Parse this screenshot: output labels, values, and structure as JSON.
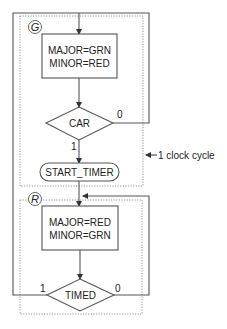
{
  "states": [
    {
      "id": "G",
      "label": "G",
      "output_line1": "MAJOR=GRN",
      "output_line2": "MINOR=RED",
      "decision": "CAR",
      "branch_true": "1",
      "branch_false": "0",
      "conditional_output": "START_TIMER"
    },
    {
      "id": "R",
      "label": "R",
      "output_line1": "MAJOR=RED",
      "output_line2": "MINOR=GRN",
      "decision": "TIMED",
      "branch_true": "1",
      "branch_false": "0"
    }
  ],
  "annotation": {
    "text": "1 clock cycle"
  },
  "colors": {
    "line": "#555555",
    "dotted": "#777777",
    "text": "#222222",
    "background": "#ffffff"
  }
}
